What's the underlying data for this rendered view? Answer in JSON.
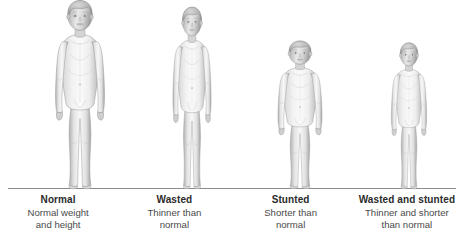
{
  "figure": {
    "background_color": "#ffffff",
    "ground_line_color": "#8d8d8d",
    "body_fill_light": "#f4f4f4",
    "body_fill_mid": "#dcdcdc",
    "body_fill_shadow": "#b4b4b4",
    "outline_color": "#9a9a9a",
    "ground_line_label": "ground-line"
  },
  "panels": [
    {
      "id": "normal",
      "title": "Normal",
      "description_line1": "Normal weight",
      "description_line2": "and height",
      "figure_alt": "child-figure-normal",
      "relative_height": 1.0,
      "relative_width": 1.0
    },
    {
      "id": "wasted",
      "title": "Wasted",
      "description_line1": "Thinner than",
      "description_line2": "normal",
      "figure_alt": "child-figure-wasted",
      "relative_height": 0.97,
      "relative_width": 0.78
    },
    {
      "id": "stunted",
      "title": "Stunted",
      "description_line1": "Shorter than",
      "description_line2": "normal",
      "figure_alt": "child-figure-stunted",
      "relative_height": 0.79,
      "relative_width": 0.96
    },
    {
      "id": "wasted-and-stunted",
      "title": "Wasted and stunted",
      "description_line1": "Thinner and shorter",
      "description_line2": "than normal",
      "figure_alt": "child-figure-wasted-and-stunted",
      "relative_height": 0.78,
      "relative_width": 0.76
    }
  ]
}
